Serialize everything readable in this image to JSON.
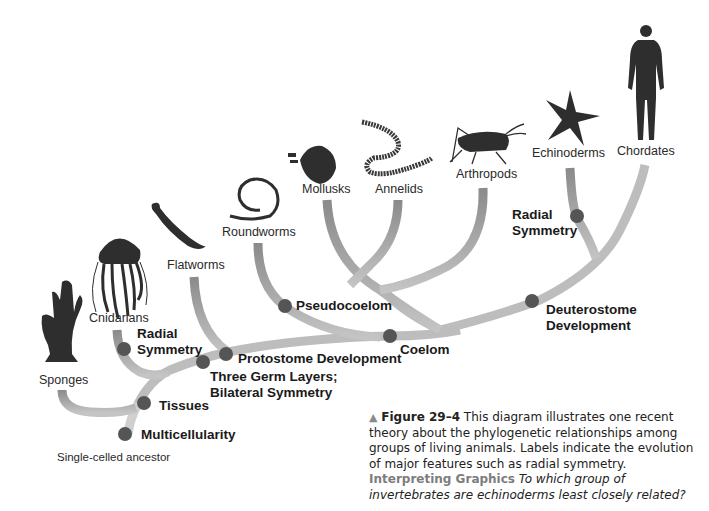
{
  "figure": {
    "number": "Figure 29–4",
    "caption_text": "This diagram illustrates one recent theory about the phylogenetic relationships among groups of living animals. Labels indicate the evolution of major features such as radial symmetry.",
    "interpreting_label": "Interpreting Graphics",
    "question": "To which group of invertebrates are echinoderms least closely related?"
  },
  "root": {
    "label": "Single-celled ancestor"
  },
  "groups": [
    {
      "id": "sponges",
      "label": "Sponges",
      "icon": "sponge-icon"
    },
    {
      "id": "cnidarians",
      "label": "Cnidarians",
      "icon": "jellyfish-icon"
    },
    {
      "id": "flatworms",
      "label": "Flatworms",
      "icon": "flatworm-icon"
    },
    {
      "id": "roundworms",
      "label": "Roundworms",
      "icon": "roundworm-icon"
    },
    {
      "id": "mollusks",
      "label": "Mollusks",
      "icon": "clam-shell-icon"
    },
    {
      "id": "annelids",
      "label": "Annelids",
      "icon": "segmented-worm-icon"
    },
    {
      "id": "arthropods",
      "label": "Arthropods",
      "icon": "grasshopper-icon"
    },
    {
      "id": "echinoderms",
      "label": "Echinoderms",
      "icon": "starfish-icon"
    },
    {
      "id": "chordates",
      "label": "Chordates",
      "icon": "human-icon"
    }
  ],
  "traits": [
    {
      "id": "multicellularity",
      "label": "Multicellularity"
    },
    {
      "id": "tissues",
      "label": "Tissues"
    },
    {
      "id": "radial_symmetry_cnidarians",
      "label_line1": "Radial",
      "label_line2": "Symmetry"
    },
    {
      "id": "three_germ_layers",
      "label_line1": "Three Germ Layers;",
      "label_line2": "Bilateral Symmetry"
    },
    {
      "id": "protostome",
      "label": "Protostome Development"
    },
    {
      "id": "pseudocoelom",
      "label": "Pseudocoelom"
    },
    {
      "id": "coelom",
      "label": "Coelom"
    },
    {
      "id": "deuterostome",
      "label_line1": "Deuterostome",
      "label_line2": "Development"
    },
    {
      "id": "radial_symmetry_echinoderms",
      "label_line1": "Radial",
      "label_line2": "Symmetry"
    }
  ],
  "colors": {
    "branch": "#b5b5b5",
    "branch_dark": "#8c8c8c",
    "node_dot": "#555555",
    "silhouette": "#2e2e2e",
    "caption_accent": "#7d7d7d"
  }
}
